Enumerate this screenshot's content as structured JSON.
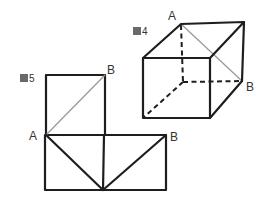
{
  "figures": [
    {
      "id": "fig4",
      "caption_number": "4",
      "caption_glyph": "図",
      "description": "Cube with hidden edges dashed and a face diagonal from A to B",
      "vertex_labels": {
        "a": "A",
        "b": "B"
      }
    },
    {
      "id": "fig5",
      "caption_number": "5",
      "caption_glyph": "図",
      "description": "Net of cube faces showing points A and B with diagonals",
      "vertex_labels": {
        "a": "A",
        "b_top": "B",
        "b_right": "B"
      }
    }
  ],
  "colors": {
    "line": "#1e1e1e",
    "diagonal": "#9a9a9a",
    "text": "#333333",
    "background": "#ffffff"
  }
}
